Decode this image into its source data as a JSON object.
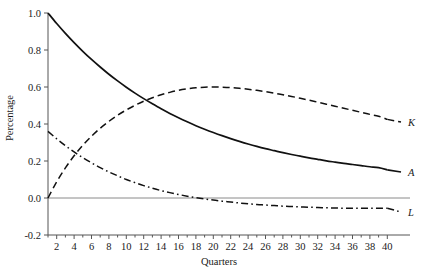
{
  "chart_data": {
    "type": "line",
    "title": "",
    "xlabel": "Quarters",
    "ylabel": "Percentage",
    "xlim": [
      1,
      41
    ],
    "ylim": [
      -0.2,
      1.0
    ],
    "grid": false,
    "legend_position": "right-end-of-line",
    "y_ticks": [
      "1.0",
      "0.8",
      "0.6",
      "0.4",
      "0.2",
      "0.0",
      "-0.2"
    ],
    "y_tick_values": [
      1.0,
      0.8,
      0.6,
      0.4,
      0.2,
      0.0,
      -0.2
    ],
    "x_ticks": [
      "2",
      "4",
      "6",
      "8",
      "10",
      "12",
      "14",
      "16",
      "18",
      "20",
      "22",
      "24",
      "26",
      "28",
      "30",
      "32",
      "34",
      "36",
      "38",
      "40"
    ],
    "x_tick_values": [
      2,
      4,
      6,
      8,
      10,
      12,
      14,
      16,
      18,
      20,
      22,
      24,
      26,
      28,
      30,
      32,
      34,
      36,
      38,
      40
    ],
    "x_minor_tick_values": [
      1,
      2,
      3,
      4,
      5,
      6,
      7,
      8,
      9,
      10,
      11,
      12,
      13,
      14,
      15,
      16,
      17,
      18,
      19,
      20,
      21,
      22,
      23,
      24,
      25,
      26,
      27,
      28,
      29,
      30,
      31,
      32,
      33,
      34,
      35,
      36,
      37,
      38,
      39,
      40
    ],
    "zero_line": 0.0,
    "x": [
      1,
      2,
      3,
      4,
      5,
      6,
      7,
      8,
      9,
      10,
      11,
      12,
      13,
      14,
      15,
      16,
      17,
      18,
      19,
      20,
      21,
      22,
      23,
      24,
      25,
      26,
      27,
      28,
      29,
      30,
      31,
      32,
      33,
      34,
      35,
      36,
      37,
      38,
      39,
      40
    ],
    "series": [
      {
        "name": "A",
        "label": "A",
        "style": "solid",
        "color": "#111111",
        "values": [
          1.0,
          0.943,
          0.89,
          0.84,
          0.793,
          0.749,
          0.708,
          0.669,
          0.633,
          0.599,
          0.567,
          0.537,
          0.509,
          0.482,
          0.457,
          0.434,
          0.412,
          0.391,
          0.372,
          0.354,
          0.337,
          0.321,
          0.306,
          0.292,
          0.279,
          0.267,
          0.256,
          0.245,
          0.235,
          0.226,
          0.217,
          0.209,
          0.201,
          0.194,
          0.187,
          0.181,
          0.175,
          0.169,
          0.164,
          0.152
        ]
      },
      {
        "name": "K",
        "label": "K",
        "style": "dashed",
        "color": "#111111",
        "values": [
          0.0,
          0.088,
          0.163,
          0.228,
          0.285,
          0.334,
          0.377,
          0.414,
          0.447,
          0.476,
          0.501,
          0.523,
          0.542,
          0.558,
          0.571,
          0.582,
          0.59,
          0.596,
          0.599,
          0.6,
          0.599,
          0.597,
          0.593,
          0.588,
          0.582,
          0.575,
          0.567,
          0.558,
          0.549,
          0.539,
          0.529,
          0.518,
          0.507,
          0.496,
          0.485,
          0.474,
          0.463,
          0.452,
          0.442,
          0.425
        ]
      },
      {
        "name": "L",
        "label": "L",
        "style": "dashdot",
        "color": "#111111",
        "values": [
          0.36,
          0.32,
          0.283,
          0.249,
          0.218,
          0.19,
          0.164,
          0.141,
          0.12,
          0.1,
          0.083,
          0.067,
          0.053,
          0.04,
          0.029,
          0.019,
          0.01,
          0.002,
          -0.005,
          -0.011,
          -0.017,
          -0.022,
          -0.027,
          -0.031,
          -0.035,
          -0.038,
          -0.041,
          -0.044,
          -0.046,
          -0.048,
          -0.05,
          -0.051,
          -0.053,
          -0.054,
          -0.055,
          -0.055,
          -0.056,
          -0.056,
          -0.056,
          -0.055
        ]
      }
    ]
  },
  "axes": {
    "ylabel": "Percentage",
    "xlabel": "Quarters"
  }
}
